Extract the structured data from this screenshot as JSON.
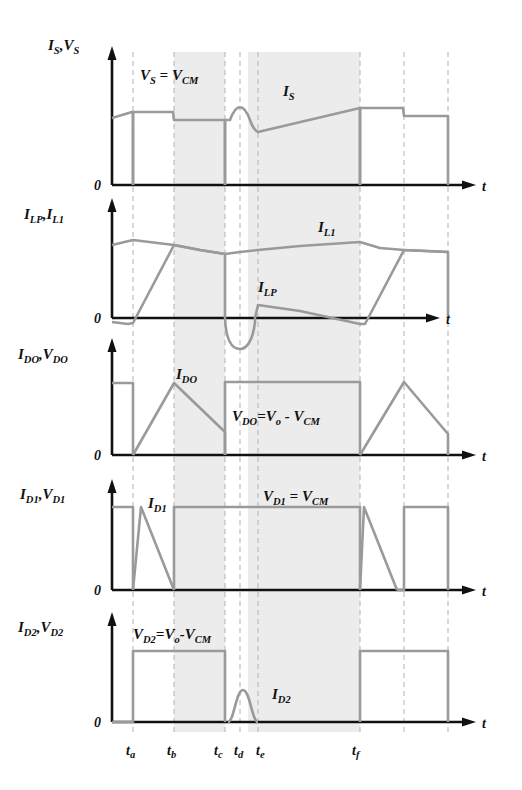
{
  "figure": {
    "type": "timing-waveform-diagram",
    "colors": {
      "trace": "#9a9a9a",
      "axis": "#111111",
      "shaded_band": "#ececec",
      "dashed_marker": "#b9b9b9",
      "background": "#ffffff"
    },
    "time_axis": {
      "label": "t",
      "zero_label": "0",
      "ticks": [
        {
          "id": "ta",
          "label": "t",
          "sub": "a",
          "x": 133
        },
        {
          "id": "tb",
          "label": "t",
          "sub": "b",
          "x": 174
        },
        {
          "id": "tc",
          "label": "t",
          "sub": "c",
          "x": 225
        },
        {
          "id": "td",
          "label": "t",
          "sub": "d",
          "x": 240
        },
        {
          "id": "te",
          "label": "t",
          "sub": "e",
          "x": 258
        },
        {
          "id": "tf",
          "label": "t",
          "sub": "f",
          "x": 360
        }
      ],
      "unlabeled_markers": [
        404,
        448
      ],
      "shaded_bands": [
        {
          "from": 174,
          "to": 225
        },
        {
          "from": 248,
          "to": 360
        }
      ]
    },
    "panels": [
      {
        "id": "panel-is-vs",
        "y_label": {
          "parts": [
            {
              "main": "I",
              "sub": "S"
            },
            {
              "main": "V",
              "sub": "S"
            }
          ]
        },
        "y_label_text": "I_S , V_S",
        "annotations": [
          {
            "id": "vs-eq",
            "text": "V_S = V_CM",
            "x": 150,
            "y": 76
          },
          {
            "id": "is-name",
            "text": "I_S",
            "x": 283,
            "y": 92
          }
        ],
        "signals": [
          "V_S",
          "I_S"
        ]
      },
      {
        "id": "panel-ilp-il1",
        "y_label": {
          "parts": [
            {
              "main": "I",
              "sub": "LP"
            },
            {
              "main": "I",
              "sub": "L1"
            }
          ]
        },
        "y_label_text": "I_LP , I_L1",
        "annotations": [
          {
            "id": "il1-name",
            "text": "I_L1",
            "x": 320,
            "y": 228
          },
          {
            "id": "ilp-name",
            "text": "I_LP",
            "x": 260,
            "y": 286
          }
        ],
        "signals": [
          "I_LP",
          "I_L1"
        ]
      },
      {
        "id": "panel-ido-vdo",
        "y_label": {
          "parts": [
            {
              "main": "I",
              "sub": "DO"
            },
            {
              "main": "V",
              "sub": "DO"
            }
          ]
        },
        "y_label_text": "I_DO , V_DO",
        "annotations": [
          {
            "id": "ido-name",
            "text": "I_DO",
            "x": 178,
            "y": 375
          },
          {
            "id": "vdo-eq",
            "text": "V_DO = V_o - V_CM",
            "x": 222,
            "y": 416
          }
        ],
        "signals": [
          "I_DO",
          "V_DO"
        ]
      },
      {
        "id": "panel-id1-vd1",
        "y_label": {
          "parts": [
            {
              "main": "I",
              "sub": "D1"
            },
            {
              "main": "V",
              "sub": "D1"
            }
          ]
        },
        "y_label_text": "I_D1 , V_D1",
        "annotations": [
          {
            "id": "id1-name",
            "text": "I_D1",
            "x": 152,
            "y": 503
          },
          {
            "id": "vd1-eq",
            "text": "V_D1 = V_CM",
            "x": 268,
            "y": 497
          }
        ],
        "signals": [
          "I_D1",
          "V_D1"
        ]
      },
      {
        "id": "panel-id2-vd2",
        "y_label": {
          "parts": [
            {
              "main": "I",
              "sub": "D2"
            },
            {
              "main": "V",
              "sub": "D2"
            }
          ]
        },
        "y_label_text": "I_D2 , V_D2",
        "annotations": [
          {
            "id": "vd2-eq",
            "text": "V_D2 = V_o - V_CM",
            "x": 133,
            "y": 634
          },
          {
            "id": "id2-name",
            "text": "I_D2",
            "x": 271,
            "y": 693
          }
        ],
        "signals": [
          "I_D2",
          "V_D2"
        ]
      }
    ]
  },
  "labels": {
    "t_axis": "t",
    "zero": "0",
    "eq_sign": "=",
    "minus_sign": "-"
  }
}
